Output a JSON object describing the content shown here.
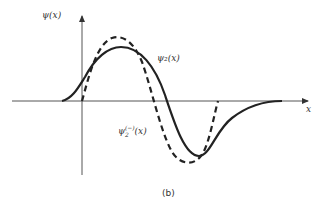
{
  "figure": {
    "caption": "(b)",
    "y_axis_label": "ψ(x)",
    "x_axis_label": "x",
    "curves": [
      {
        "name": "psi2",
        "label": "ψ₂(x)",
        "style": "solid",
        "color": "#222222"
      },
      {
        "name": "psi2-minus",
        "label_base": "ψ",
        "label_sub": "2",
        "label_sup": "(−)",
        "label_arg": "(x)",
        "style": "dashed",
        "color": "#222222"
      }
    ]
  }
}
